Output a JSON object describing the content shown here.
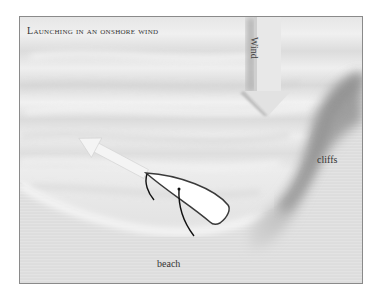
{
  "page": {
    "cut_text": "partially visible caption text cut off at top edge"
  },
  "diagram": {
    "title": "Launching in an onshore wind",
    "labels": {
      "wind": "Wind",
      "cliffs": "cliffs",
      "beach": "beach"
    },
    "elements": [
      {
        "name": "wind-arrow",
        "direction": "down",
        "description": "large gray arrow pointing toward the shore"
      },
      {
        "name": "course-arrow",
        "direction": "up-left",
        "description": "light arrow showing the boat's heading away from beach"
      },
      {
        "name": "dinghy",
        "description": "white boat outline on the beach, bow pointing up-left"
      },
      {
        "name": "cliffs-shadow",
        "description": "dark diagonal shading on right"
      },
      {
        "name": "shoreline",
        "description": "curved waterline around the beach"
      }
    ],
    "colors": {
      "background": "#e4e4e4",
      "water_light": "#f2f2f2",
      "water_dark": "#d2d2d2",
      "cliff_shadow": "#8c8c8c",
      "boat_fill": "#ffffff",
      "boat_stroke": "#3a3a3a",
      "frame_border": "#8a8a8a"
    }
  }
}
